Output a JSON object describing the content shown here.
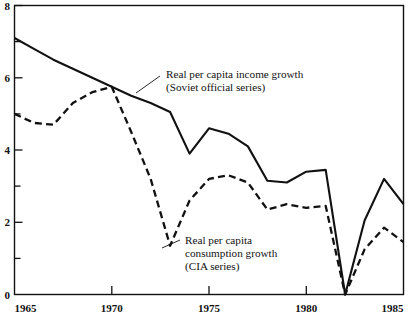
{
  "chart_data": {
    "type": "line",
    "title": "",
    "subtitle": "",
    "xlabel": "",
    "ylabel": "",
    "xlim": [
      1965,
      1985
    ],
    "ylim": [
      0,
      8
    ],
    "grid": false,
    "legend_position": "inline-annotations",
    "x_ticks": [
      1965,
      1970,
      1975,
      1980,
      1985
    ],
    "x_tick_labels": [
      "1965",
      "1970",
      "1975",
      "1980",
      "1985"
    ],
    "y_ticks": [
      0,
      1,
      2,
      3,
      4,
      5,
      6,
      7,
      8
    ],
    "y_tick_labels": [
      "0",
      "",
      "2",
      "",
      "4",
      "",
      "6",
      "",
      "8"
    ],
    "y_major_labels": [
      "0",
      "2",
      "4",
      "6",
      "8"
    ],
    "x": [
      1965,
      1966,
      1967,
      1968,
      1969,
      1970,
      1971,
      1972,
      1973,
      1974,
      1975,
      1976,
      1977,
      1978,
      1979,
      1980,
      1981,
      1982,
      1983,
      1984,
      1985
    ],
    "series": [
      {
        "name": "Real per capita income growth (Soviet official series)",
        "style": "solid",
        "values": [
          7.1,
          6.8,
          6.5,
          6.25,
          6.0,
          5.75,
          5.5,
          5.3,
          5.05,
          3.9,
          4.6,
          4.45,
          4.1,
          3.15,
          3.1,
          3.4,
          3.45,
          0.0,
          2.05,
          3.2,
          2.5
        ]
      },
      {
        "name": "Real per capita consumption growth (CIA series)",
        "style": "dashed",
        "values": [
          5.0,
          4.75,
          4.7,
          5.3,
          5.6,
          5.75,
          4.5,
          3.2,
          1.35,
          2.6,
          3.2,
          3.3,
          3.1,
          2.35,
          2.5,
          2.4,
          2.45,
          0.0,
          1.25,
          1.85,
          1.45
        ]
      }
    ],
    "annotations": [
      {
        "id": "income-annotation",
        "lines": [
          "Real per capita income growth",
          "(Soviet official series)"
        ],
        "line1": "Real per capita income growth",
        "line2": "(Soviet official series)"
      },
      {
        "id": "consumption-annotation",
        "lines": [
          "Real per capita",
          "consumption growth",
          "(CIA series)"
        ],
        "line1": "Real per capita",
        "line2": "consumption growth",
        "line3": "(CIA series)"
      }
    ],
    "colors": {
      "line": "#111111",
      "background": "#ffffff",
      "axis": "#111111"
    }
  },
  "axis": {
    "y": {
      "label_8": "8",
      "label_6": "6",
      "label_4": "4",
      "label_2": "2",
      "label_0": "0"
    },
    "x": {
      "label_1965": "1965",
      "label_1970": "1970",
      "label_1975": "1975",
      "label_1980": "1980",
      "label_1985": "1985"
    }
  }
}
